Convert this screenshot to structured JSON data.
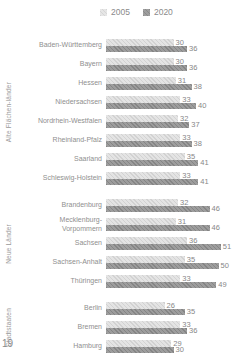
{
  "legend": {
    "items": [
      {
        "label": "2005",
        "color": "#e4e4e4"
      },
      {
        "label": "2020",
        "color": "#9d9d9d"
      }
    ]
  },
  "page_number": "19",
  "chart_data": {
    "type": "bar",
    "orientation": "horizontal",
    "series_names": [
      "2005",
      "2020"
    ],
    "x_max": 51,
    "legend_position": "top",
    "grid": false,
    "colors": {
      "series_2005": "#e4e4e4",
      "series_2020": "#9d9d9d"
    },
    "groups": [
      {
        "label": "Alte Flächen-länder",
        "rows": [
          {
            "name": "Baden-Württemberg",
            "values": [
              30,
              36
            ]
          },
          {
            "name": "Bayern",
            "values": [
              30,
              36
            ]
          },
          {
            "name": "Hessen",
            "values": [
              31,
              38
            ]
          },
          {
            "name": "Niedersachsen",
            "values": [
              33,
              40
            ]
          },
          {
            "name": "Nordrhein-Westfalen",
            "values": [
              32,
              37
            ]
          },
          {
            "name": "Rheinland-Pfalz",
            "values": [
              33,
              38
            ]
          },
          {
            "name": "Saarland",
            "values": [
              35,
              41
            ]
          },
          {
            "name": "Schleswig-Holstein",
            "values": [
              33,
              41
            ]
          }
        ]
      },
      {
        "label": "Neue Länder",
        "rows": [
          {
            "name": "Brandenburg",
            "values": [
              32,
              46
            ]
          },
          {
            "name": "Mecklenburg-\nVorpommern",
            "values": [
              31,
              46
            ]
          },
          {
            "name": "Sachsen",
            "values": [
              36,
              51
            ]
          },
          {
            "name": "Sachsen-Anhalt",
            "values": [
              35,
              50
            ]
          },
          {
            "name": "Thüringen",
            "values": [
              33,
              49
            ]
          }
        ]
      },
      {
        "label": "Stadtstaaten",
        "rows": [
          {
            "name": "Berlin",
            "values": [
              26,
              35
            ]
          },
          {
            "name": "Bremen",
            "values": [
              33,
              36
            ]
          },
          {
            "name": "Hamburg",
            "values": [
              29,
              30
            ]
          }
        ]
      }
    ]
  }
}
